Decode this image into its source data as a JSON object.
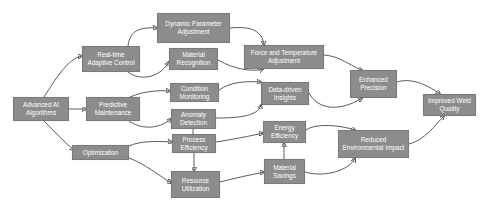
{
  "diagram": {
    "type": "flowchart",
    "colors": {
      "node_fill": "#8c8c8c",
      "node_text": "#ffffff",
      "edge": "#4a4a4a",
      "background": "#ffffff"
    },
    "nodes": [
      {
        "id": "ai",
        "label": "Advanced AI Algorithms",
        "x": 13,
        "y": 97,
        "w": 56,
        "h": 24
      },
      {
        "id": "rac",
        "label": "Real-time Adaptive Control",
        "x": 82,
        "y": 46,
        "w": 58,
        "h": 26
      },
      {
        "id": "pm",
        "label": "Predictive Maintenance",
        "x": 86,
        "y": 97,
        "w": 54,
        "h": 24
      },
      {
        "id": "opt",
        "label": "Optimization",
        "x": 72,
        "y": 145,
        "w": 57,
        "h": 15
      },
      {
        "id": "dpa",
        "label": "Dynamic Parameter Adjustment",
        "x": 157,
        "y": 13,
        "w": 73,
        "h": 30
      },
      {
        "id": "mr",
        "label": "Material Recognition",
        "x": 169,
        "y": 48,
        "w": 49,
        "h": 22
      },
      {
        "id": "cm",
        "label": "Condition Monitoring",
        "x": 170,
        "y": 83,
        "w": 49,
        "h": 19
      },
      {
        "id": "ad",
        "label": "Anomaly Detection",
        "x": 171,
        "y": 109,
        "w": 45,
        "h": 20
      },
      {
        "id": "pe",
        "label": "Process Efficiency",
        "x": 172,
        "y": 134,
        "w": 44,
        "h": 19
      },
      {
        "id": "ru",
        "label": "Resource Utilization",
        "x": 171,
        "y": 171,
        "w": 49,
        "h": 27
      },
      {
        "id": "fta",
        "label": "Force and Temperature Adjustment",
        "x": 244,
        "y": 45,
        "w": 80,
        "h": 24
      },
      {
        "id": "ddi",
        "label": "Data-driven Insights",
        "x": 261,
        "y": 82,
        "w": 48,
        "h": 23
      },
      {
        "id": "ee",
        "label": "Energy Efficiency",
        "x": 263,
        "y": 121,
        "w": 43,
        "h": 22
      },
      {
        "id": "ms",
        "label": "Material Savings",
        "x": 264,
        "y": 159,
        "w": 41,
        "h": 25
      },
      {
        "id": "ep",
        "label": "Enhanced Precision",
        "x": 350,
        "y": 70,
        "w": 47,
        "h": 28
      },
      {
        "id": "rei",
        "label": "Reduced Environmental Impact",
        "x": 338,
        "y": 130,
        "w": 71,
        "h": 28
      },
      {
        "id": "iwq",
        "label": "Improved Weld Quality",
        "x": 423,
        "y": 94,
        "w": 53,
        "h": 22
      }
    ],
    "edges": [
      {
        "from": "ai",
        "to": "rac"
      },
      {
        "from": "ai",
        "to": "pm"
      },
      {
        "from": "ai",
        "to": "opt"
      },
      {
        "from": "rac",
        "to": "dpa"
      },
      {
        "from": "rac",
        "to": "mr"
      },
      {
        "from": "pm",
        "to": "cm"
      },
      {
        "from": "pm",
        "to": "ad"
      },
      {
        "from": "opt",
        "to": "pe"
      },
      {
        "from": "opt",
        "to": "ru"
      },
      {
        "from": "ad",
        "to": "pe"
      },
      {
        "from": "pe",
        "to": "ru"
      },
      {
        "from": "dpa",
        "to": "fta"
      },
      {
        "from": "mr",
        "to": "fta"
      },
      {
        "from": "cm",
        "to": "ddi"
      },
      {
        "from": "ad",
        "to": "ddi"
      },
      {
        "from": "pe",
        "to": "ee"
      },
      {
        "from": "ru",
        "to": "ms"
      },
      {
        "from": "ms",
        "to": "ee"
      },
      {
        "from": "fta",
        "to": "ep"
      },
      {
        "from": "ddi",
        "to": "ep"
      },
      {
        "from": "ee",
        "to": "rei"
      },
      {
        "from": "ms",
        "to": "rei"
      },
      {
        "from": "ep",
        "to": "iwq"
      },
      {
        "from": "rei",
        "to": "iwq"
      }
    ]
  }
}
